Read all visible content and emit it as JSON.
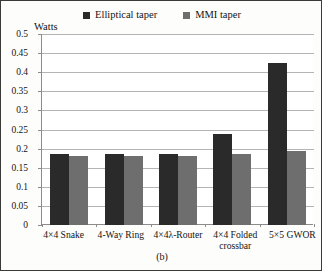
{
  "figure": {
    "caption": "(b)",
    "border_color": "#3a3a38",
    "background": "#ffffff"
  },
  "legend": {
    "position": "top-center",
    "entries": [
      {
        "label": "Elliptical taper",
        "color": "#2a2a2a",
        "swatch": "filled-square"
      },
      {
        "label": "MMI taper",
        "color": "#6e6e6e",
        "swatch": "filled-square"
      }
    ]
  },
  "axes": {
    "y_title": "Watts",
    "y_ticks": [
      "0.5",
      "0.45",
      "0.4",
      "0.35",
      "0.3",
      "0.25",
      "0.2",
      "0.15",
      "0.1",
      "0.05",
      "0"
    ],
    "x_categories": [
      "4×4 Snake",
      "4-Way Ring",
      "4×4λ-Router",
      "4×4 Folded crossbar",
      "5×5 GWOR"
    ]
  },
  "chart_data": {
    "type": "bar",
    "title": "",
    "subtitle": "(b)",
    "xlabel": "",
    "ylabel": "Watts",
    "ylim": [
      0,
      0.5
    ],
    "ytick_step": 0.05,
    "grid": "horizontal",
    "legend_position": "top-center",
    "categories": [
      "4×4 Snake",
      "4-Way Ring",
      "4×4λ-Router",
      "4×4 Folded crossbar",
      "5×5 GWOR"
    ],
    "series": [
      {
        "name": "Elliptical taper",
        "color": "#2a2a2a",
        "values": [
          0.186,
          0.185,
          0.187,
          0.238,
          0.425
        ]
      },
      {
        "name": "MMI taper",
        "color": "#6e6e6e",
        "values": [
          0.181,
          0.181,
          0.18,
          0.187,
          0.194
        ]
      }
    ]
  }
}
